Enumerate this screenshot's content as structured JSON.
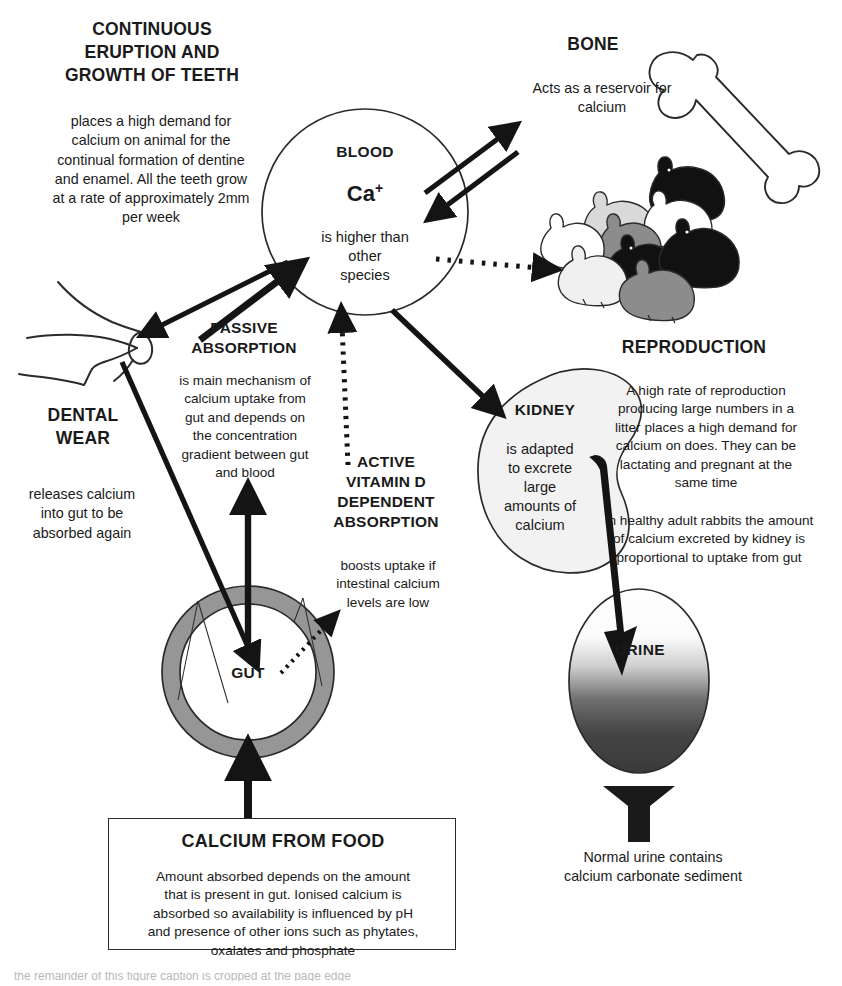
{
  "diagram": {
    "title_concept": "Calcium metabolism in the rabbit",
    "colors": {
      "ink": "#1a1a1a",
      "line": "#2b2b2b",
      "gut_ring": "#969696",
      "kidney_fill": "#f2f2f2",
      "urine_dark": "#3a3a3a",
      "rabbit_light": "#ffffff",
      "rabbit_midlight": "#d9d9d9",
      "rabbit_mid": "#8c8c8c",
      "rabbit_dark": "#111111"
    },
    "nodes": {
      "teeth": {
        "heading": "CONTINUOUS\nERUPTION AND\nGROWTH OF TEETH",
        "body": "places a high demand for\ncalcium on animal for the\ncontinual formation of dentine\nand enamel. All the teeth grow\nat a rate of approximately 2mm\nper week",
        "icon": "rabbit-skull-incisors"
      },
      "bone": {
        "heading": "BONE",
        "body": "Acts as a reservoir for\ncalcium",
        "icon": "long-bone"
      },
      "blood": {
        "heading": "BLOOD",
        "ion": "Ca",
        "ion_charge": "+",
        "body": "is higher than\nother\nspecies",
        "shape": "circle"
      },
      "reproduction": {
        "heading": "REPRODUCTION",
        "body": "A high rate of reproduction\nproducing large numbers in a\nlitter places a high demand for\ncalcium on does. They can be\nlactating and pregnant at the\nsame time",
        "body2": "In healthy adult rabbits the amount\nof calcium excreted by kidney is\nproportional to uptake from gut",
        "icon": "rabbit-litter-cluster"
      },
      "kidney": {
        "heading": "KIDNEY",
        "body": "is adapted\nto excrete\nlarge\namounts of\ncalcium",
        "shape": "kidney-bean"
      },
      "urine": {
        "heading": "URINE",
        "caption": "Normal urine contains\ncalcium carbonate sediment",
        "shape": "ellipse-gradient"
      },
      "dental_wear": {
        "heading": "DENTAL\nWEAR",
        "body": "releases calcium\ninto gut to be\nabsorbed again"
      },
      "passive_absorption": {
        "heading": "PASSIVE\nABSORPTION",
        "body": "is main mechanism of\ncalcium uptake from\ngut and depends on\nthe concentration\ngradient between gut\nand blood"
      },
      "active_vitd": {
        "heading": "ACTIVE\nVITAMIN D\nDEPENDENT\nABSORPTION",
        "body": "boosts uptake if\nintestinal calcium\nlevels are low"
      },
      "gut": {
        "heading": "GUT",
        "shape": "annulus"
      },
      "food": {
        "heading": "CALCIUM FROM FOOD",
        "body": "Amount absorbed depends on the amount\nthat is present in gut. Ionised calcium is\nabsorbed so availability is influenced by pH\nand presence of other ions such as phytates,\noxalates and phosphate"
      }
    },
    "arrows": [
      {
        "name": "bone-to-blood",
        "from": "bone",
        "to": "blood",
        "style": "solid",
        "direction": "one-way"
      },
      {
        "name": "blood-to-bone",
        "from": "blood",
        "to": "bone",
        "style": "solid",
        "direction": "one-way"
      },
      {
        "name": "blood-to-reproduction",
        "from": "blood",
        "to": "reproduction",
        "style": "dotted",
        "direction": "one-way"
      },
      {
        "name": "blood-to-teeth",
        "from": "blood",
        "to": "teeth",
        "style": "solid",
        "direction": "one-way"
      },
      {
        "name": "teeth-to-gut",
        "from": "teeth",
        "to": "gut",
        "style": "solid",
        "direction": "one-way"
      },
      {
        "name": "gut-to-blood-passive",
        "from": "gut",
        "to": "blood",
        "style": "solid",
        "direction": "one-way"
      },
      {
        "name": "gut-to-blood-active",
        "from": "gut",
        "to": "blood",
        "style": "dotted",
        "direction": "one-way"
      },
      {
        "name": "blood-to-kidney",
        "from": "blood",
        "to": "kidney",
        "style": "solid",
        "direction": "one-way"
      },
      {
        "name": "kidney-to-urine",
        "from": "kidney",
        "to": "urine",
        "style": "solid-tapered",
        "direction": "one-way"
      },
      {
        "name": "urine-to-sediment",
        "from": "urine",
        "to": "sediment",
        "style": "solid-funnel",
        "direction": "one-way"
      },
      {
        "name": "food-to-gut",
        "from": "food",
        "to": "gut",
        "style": "solid",
        "direction": "one-way"
      }
    ]
  },
  "footer": {
    "cut_off_line": "the remainder of this figure caption is cropped at the page edge"
  }
}
